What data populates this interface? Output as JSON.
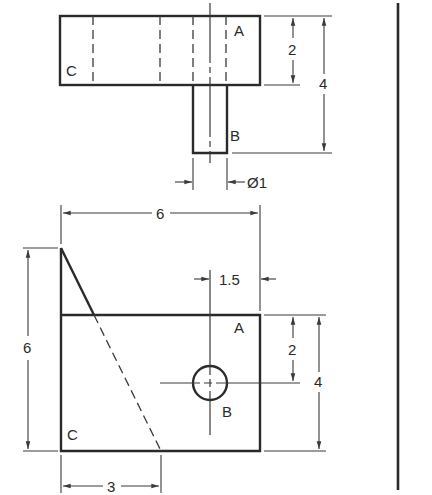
{
  "drawing": {
    "type": "orthographic-projection",
    "views": [
      "top",
      "front"
    ],
    "top_view": {
      "labels": {
        "a": "A",
        "b": "B",
        "c": "C"
      },
      "dimensions": {
        "height_2": "2",
        "height_4": "4",
        "diameter": "Ø1"
      }
    },
    "front_view": {
      "labels": {
        "a": "A",
        "b": "B",
        "c": "C"
      },
      "dimensions": {
        "width_6": "6",
        "height_6": "6",
        "offset_1_5": "1.5",
        "height_2": "2",
        "height_4": "4",
        "width_3": "3"
      }
    },
    "colors": {
      "line": "#2a2a2a",
      "background": "#ffffff"
    }
  }
}
